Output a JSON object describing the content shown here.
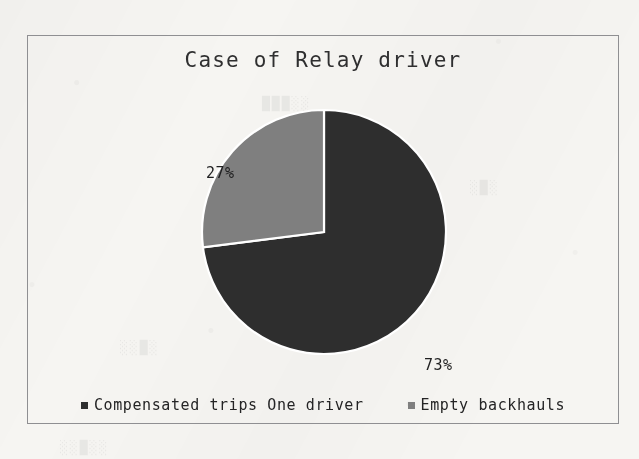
{
  "chart_data": {
    "type": "pie",
    "title": "Case of Relay driver",
    "categories": [
      "Compensated trips One driver",
      "Empty backhauls"
    ],
    "values": [
      73,
      27
    ],
    "value_labels": [
      "73%",
      "27%"
    ],
    "units": "percent",
    "total": 100,
    "start_angle_deg": 0,
    "direction": "clockwise",
    "legend_position": "bottom",
    "grid": false,
    "xlabel": "",
    "ylabel": "",
    "colors": [
      "#2e2e2e",
      "#7f7f7f"
    ],
    "slice_border_color": "#ffffff",
    "slices": [
      {
        "name": "Compensated trips One driver",
        "value": 73,
        "label": "73%",
        "color": "#2e2e2e",
        "start_deg": 0,
        "end_deg": 262.8
      },
      {
        "name": "Empty backhauls",
        "value": 27,
        "label": "27%",
        "color": "#7f7f7f",
        "start_deg": 262.8,
        "end_deg": 360
      }
    ]
  },
  "frame": {
    "border_color": "#8f8f92"
  },
  "legend": {
    "items": [
      {
        "label": "Compensated trips One driver",
        "color": "#2e2e2e"
      },
      {
        "label": "Empty backhauls",
        "color": "#7f7f7f"
      }
    ]
  },
  "background": {
    "paper_color": "#f6f5f2"
  }
}
